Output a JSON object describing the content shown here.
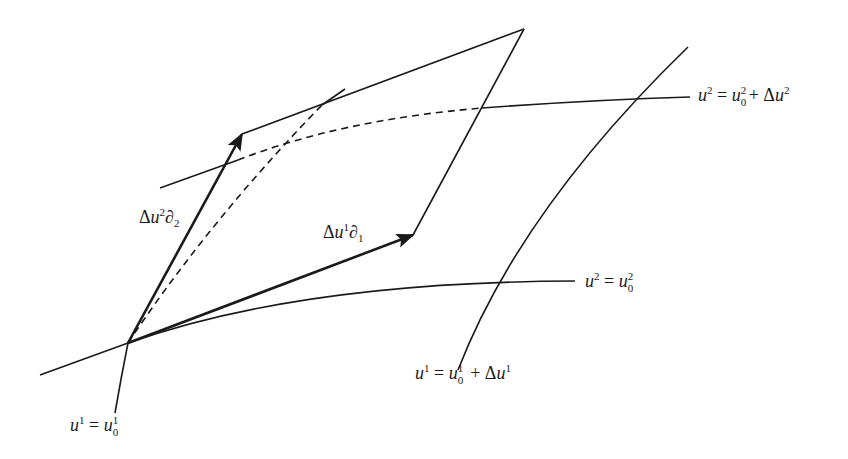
{
  "figure": {
    "title": ""
  },
  "colors": {
    "ink": "#1a1a1a",
    "background": "#ffffff"
  },
  "labels": {
    "curve_u2_plus": {
      "lhs_var": "u",
      "lhs_sup": "2",
      "eq": "=",
      "rhs_var": "u",
      "rhs_sup": "2",
      "rhs_sub": "0",
      "plus": "+",
      "delta": "Δ",
      "delta_var": "u",
      "delta_sup": "2",
      "text": "u² = u²₀ + Δu²"
    },
    "curve_u2_0": {
      "lhs_var": "u",
      "lhs_sup": "2",
      "eq": "=",
      "rhs_var": "u",
      "rhs_sub": "0",
      "rhs_sup": "2",
      "text": "u² = u₀²"
    },
    "curve_u1_plus": {
      "lhs_var": "u",
      "lhs_sup": "1",
      "eq": "=",
      "rhs_var": "u",
      "rhs_sub": "0",
      "rhs_sup": "1",
      "plus": "+",
      "delta": "Δ",
      "delta_var": "u",
      "delta_sup": "1",
      "text": "u¹ = u₀¹ + Δu¹"
    },
    "curve_u1_0": {
      "lhs_var": "u",
      "lhs_sup": "1",
      "eq": "=",
      "rhs_var": "u",
      "rhs_sub": "0",
      "rhs_sup": "1",
      "text": "u¹ = u₀¹"
    },
    "vector_2": {
      "delta": "Δ",
      "var": "u",
      "sup": "2",
      "partial": "∂",
      "sub": "2",
      "text": "Δu²∂₂"
    },
    "vector_1": {
      "delta": "Δ",
      "var": "u",
      "sup": "1",
      "partial": "∂",
      "sub": "1",
      "text": "Δu¹∂₁"
    }
  },
  "geometry": {
    "origin": [
      128,
      343
    ],
    "vector_2_tip": [
      242,
      134
    ],
    "vector_1_tip": [
      413,
      235
    ],
    "parallelogram_far_corner": [
      524,
      29
    ]
  }
}
